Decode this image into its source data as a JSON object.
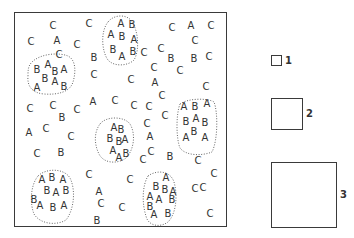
{
  "figure": {
    "frame": {
      "x": 14,
      "y": 12,
      "width": 213,
      "height": 215
    }
  },
  "clusters": [
    {
      "id": "cluster-1",
      "path": "M32,62 C40,54 58,52 68,56 C76,60 76,72 73,82 C70,92 58,95 44,94 C32,93 27,86 28,76 C28,70 28,66 32,62 Z"
    },
    {
      "id": "cluster-2",
      "path": "M108,22 C114,14 128,14 132,22 C138,30 140,50 134,60 C128,66 114,67 108,60 C102,52 100,32 108,22 Z"
    },
    {
      "id": "cluster-3",
      "path": "M100,124 C106,116 124,116 130,124 C136,134 134,150 126,158 C118,164 104,164 99,154 C94,144 94,132 100,124 Z"
    },
    {
      "id": "cluster-4",
      "path": "M180,104 C188,98 208,98 214,102 C218,112 218,140 212,152 C202,156 186,156 180,148 C176,138 176,114 180,104 Z"
    },
    {
      "id": "cluster-5",
      "path": "M38,176 C46,168 64,168 70,178 C76,190 74,210 66,220 C56,226 40,224 34,214 C30,204 30,186 38,176 Z"
    },
    {
      "id": "cluster-6",
      "path": "M148,176 C156,170 170,170 174,182 C178,196 176,214 168,222 C160,228 148,226 146,216 C142,204 142,186 148,176 Z"
    }
  ],
  "letters": [
    {
      "t": "C",
      "x": 53,
      "y": 26
    },
    {
      "t": "C",
      "x": 89,
      "y": 24
    },
    {
      "t": "C",
      "x": 31,
      "y": 42
    },
    {
      "t": "A",
      "x": 57,
      "y": 41
    },
    {
      "t": "C",
      "x": 77,
      "y": 45
    },
    {
      "t": "C",
      "x": 59,
      "y": 55
    },
    {
      "t": "B",
      "x": 94,
      "y": 58
    },
    {
      "t": "C",
      "x": 94,
      "y": 75
    },
    {
      "t": "B",
      "x": 37,
      "y": 70
    },
    {
      "t": "A",
      "x": 48,
      "y": 65
    },
    {
      "t": "B",
      "x": 55,
      "y": 72
    },
    {
      "t": "A",
      "x": 64,
      "y": 70
    },
    {
      "t": "B",
      "x": 45,
      "y": 79
    },
    {
      "t": "A",
      "x": 55,
      "y": 82
    },
    {
      "t": "B",
      "x": 64,
      "y": 87
    },
    {
      "t": "A",
      "x": 37,
      "y": 88
    },
    {
      "t": "A",
      "x": 121,
      "y": 24
    },
    {
      "t": "B",
      "x": 132,
      "y": 25
    },
    {
      "t": "A",
      "x": 111,
      "y": 35
    },
    {
      "t": "B",
      "x": 122,
      "y": 37
    },
    {
      "t": "A",
      "x": 134,
      "y": 40
    },
    {
      "t": "B",
      "x": 113,
      "y": 50
    },
    {
      "t": "A",
      "x": 122,
      "y": 57
    },
    {
      "t": "B",
      "x": 133,
      "y": 52
    },
    {
      "t": "C",
      "x": 144,
      "y": 53
    },
    {
      "t": "C",
      "x": 161,
      "y": 49
    },
    {
      "t": "C",
      "x": 172,
      "y": 28
    },
    {
      "t": "A",
      "x": 191,
      "y": 26
    },
    {
      "t": "C",
      "x": 211,
      "y": 26
    },
    {
      "t": "C",
      "x": 195,
      "y": 41
    },
    {
      "t": "B",
      "x": 171,
      "y": 59
    },
    {
      "t": "B",
      "x": 194,
      "y": 59
    },
    {
      "t": "C",
      "x": 209,
      "y": 57
    },
    {
      "t": "C",
      "x": 154,
      "y": 68
    },
    {
      "t": "C",
      "x": 180,
      "y": 71
    },
    {
      "t": "C",
      "x": 131,
      "y": 80
    },
    {
      "t": "A",
      "x": 155,
      "y": 83
    },
    {
      "t": "C",
      "x": 206,
      "y": 87
    },
    {
      "t": "C",
      "x": 162,
      "y": 96
    },
    {
      "t": "C",
      "x": 165,
      "y": 116
    },
    {
      "t": "C",
      "x": 30,
      "y": 109
    },
    {
      "t": "C",
      "x": 53,
      "y": 106
    },
    {
      "t": "B",
      "x": 62,
      "y": 118
    },
    {
      "t": "C",
      "x": 77,
      "y": 110
    },
    {
      "t": "A",
      "x": 93,
      "y": 102
    },
    {
      "t": "C",
      "x": 115,
      "y": 101
    },
    {
      "t": "C",
      "x": 134,
      "y": 106
    },
    {
      "t": "C",
      "x": 149,
      "y": 107
    },
    {
      "t": "A",
      "x": 29,
      "y": 133
    },
    {
      "t": "C",
      "x": 46,
      "y": 129
    },
    {
      "t": "C",
      "x": 71,
      "y": 137
    },
    {
      "t": "C",
      "x": 37,
      "y": 154
    },
    {
      "t": "B",
      "x": 61,
      "y": 153
    },
    {
      "t": "A",
      "x": 114,
      "y": 128
    },
    {
      "t": "B",
      "x": 121,
      "y": 130
    },
    {
      "t": "B",
      "x": 110,
      "y": 139
    },
    {
      "t": "B",
      "x": 119,
      "y": 142
    },
    {
      "t": "A",
      "x": 125,
      "y": 140
    },
    {
      "t": "A",
      "x": 113,
      "y": 151
    },
    {
      "t": "A",
      "x": 119,
      "y": 158
    },
    {
      "t": "B",
      "x": 126,
      "y": 154
    },
    {
      "t": "C",
      "x": 147,
      "y": 124
    },
    {
      "t": "A",
      "x": 150,
      "y": 137
    },
    {
      "t": "C",
      "x": 151,
      "y": 152
    },
    {
      "t": "B",
      "x": 170,
      "y": 157
    },
    {
      "t": "A",
      "x": 184,
      "y": 107
    },
    {
      "t": "B",
      "x": 195,
      "y": 107
    },
    {
      "t": "A",
      "x": 207,
      "y": 104
    },
    {
      "t": "B",
      "x": 186,
      "y": 122
    },
    {
      "t": "A",
      "x": 196,
      "y": 119
    },
    {
      "t": "B",
      "x": 205,
      "y": 123
    },
    {
      "t": "A",
      "x": 186,
      "y": 138
    },
    {
      "t": "B",
      "x": 194,
      "y": 132
    },
    {
      "t": "A",
      "x": 205,
      "y": 138
    },
    {
      "t": "C",
      "x": 198,
      "y": 161
    },
    {
      "t": "C",
      "x": 214,
      "y": 174
    },
    {
      "t": "C",
      "x": 195,
      "y": 189
    },
    {
      "t": "C",
      "x": 210,
      "y": 214
    },
    {
      "t": "C",
      "x": 89,
      "y": 175
    },
    {
      "t": "A",
      "x": 99,
      "y": 192
    },
    {
      "t": "C",
      "x": 101,
      "y": 204
    },
    {
      "t": "B",
      "x": 97,
      "y": 221
    },
    {
      "t": "C",
      "x": 130,
      "y": 180
    },
    {
      "t": "C",
      "x": 122,
      "y": 208
    },
    {
      "t": "C",
      "x": 143,
      "y": 160
    },
    {
      "t": "A",
      "x": 42,
      "y": 180
    },
    {
      "t": "B",
      "x": 52,
      "y": 178
    },
    {
      "t": "A",
      "x": 63,
      "y": 180
    },
    {
      "t": "B",
      "x": 47,
      "y": 191
    },
    {
      "t": "A",
      "x": 56,
      "y": 193
    },
    {
      "t": "B",
      "x": 66,
      "y": 191
    },
    {
      "t": "B",
      "x": 34,
      "y": 200
    },
    {
      "t": "A",
      "x": 40,
      "y": 206
    },
    {
      "t": "B",
      "x": 53,
      "y": 208
    },
    {
      "t": "A",
      "x": 64,
      "y": 206
    },
    {
      "t": "A",
      "x": 166,
      "y": 178
    },
    {
      "t": "B",
      "x": 156,
      "y": 187
    },
    {
      "t": "B",
      "x": 165,
      "y": 190
    },
    {
      "t": "A",
      "x": 173,
      "y": 192
    },
    {
      "t": "A",
      "x": 150,
      "y": 197
    },
    {
      "t": "A",
      "x": 159,
      "y": 200
    },
    {
      "t": "B",
      "x": 172,
      "y": 200
    },
    {
      "t": "B",
      "x": 150,
      "y": 207
    },
    {
      "t": "A",
      "x": 154,
      "y": 215
    },
    {
      "t": "B",
      "x": 168,
      "y": 214
    },
    {
      "t": "C",
      "x": 203,
      "y": 188
    }
  ],
  "quadrats": [
    {
      "label": "1",
      "x": 271,
      "y": 55,
      "size": 11
    },
    {
      "label": "2",
      "x": 271,
      "y": 98,
      "size": 32
    },
    {
      "label": "3",
      "x": 271,
      "y": 162,
      "size": 66
    }
  ]
}
